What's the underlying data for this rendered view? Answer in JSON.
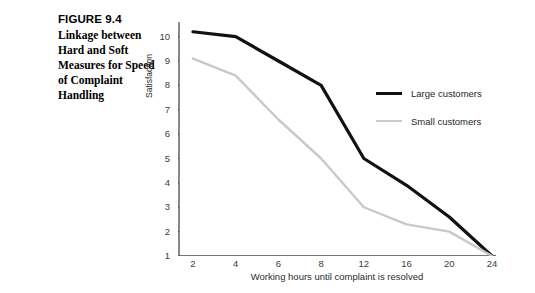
{
  "caption": {
    "figure_number": "FIGURE 9.4",
    "lines": [
      "Linkage between",
      "Hard and Soft",
      "Measures for Speed",
      "of Complaint",
      "Handling"
    ]
  },
  "colors": {
    "large_customers": "#111111",
    "small_customers": "#c9c9c9",
    "axis": "#4a4a4a",
    "tick_text": "#3b3b3b"
  },
  "chart_data": {
    "type": "line",
    "title": "",
    "xlabel": "Working hours until complaint is resolved",
    "ylabel": "Satisfaction",
    "categories": [
      "2",
      "4",
      "6",
      "8",
      "12",
      "16",
      "20",
      "24"
    ],
    "ylim": [
      1,
      10.6
    ],
    "yticks": [
      "1",
      "2",
      "3",
      "4",
      "5",
      "6",
      "7",
      "8",
      "9",
      "10"
    ],
    "grid": false,
    "legend_position": "right-upper",
    "series": [
      {
        "name": "Large customers",
        "color": "#111111",
        "width": 3.2,
        "values": [
          10.2,
          10.0,
          9.0,
          8.0,
          5.0,
          3.9,
          2.6,
          1.0
        ]
      },
      {
        "name": "Small customers",
        "color": "#c9c9c9",
        "width": 2.4,
        "values": [
          9.1,
          8.4,
          6.6,
          5.0,
          3.0,
          2.3,
          2.0,
          1.0
        ]
      }
    ]
  }
}
